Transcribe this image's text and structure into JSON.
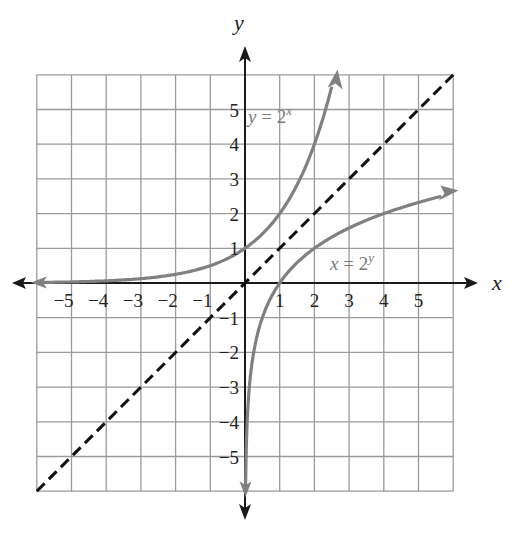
{
  "chart_data": {
    "type": "line",
    "title": "",
    "xlabel": "x",
    "ylabel": "y",
    "xlim": [
      -6,
      6
    ],
    "ylim": [
      -6,
      6
    ],
    "grid": true,
    "x_ticks": [
      -5,
      -4,
      -3,
      -2,
      -1,
      1,
      2,
      3,
      4,
      5
    ],
    "y_ticks": [
      -5,
      -4,
      -3,
      -2,
      -1,
      1,
      2,
      3,
      4,
      5
    ],
    "x_tick_labels": [
      "−5",
      "−4",
      "−3",
      "−2",
      "−1",
      "1",
      "2",
      "3",
      "4",
      "5"
    ],
    "y_tick_labels": [
      "−5",
      "−4",
      "−3",
      "−2",
      "−1",
      "1",
      "2",
      "3",
      "4",
      "5"
    ],
    "series": [
      {
        "name": "y = 2^x",
        "label_main": "y = 2",
        "label_sup": "x",
        "style": "solid",
        "color": "#808080",
        "x": [
          -6,
          -5,
          -4,
          -3,
          -2,
          -1,
          0,
          1,
          2,
          2.5
        ],
        "y": [
          0.016,
          0.031,
          0.063,
          0.125,
          0.25,
          0.5,
          1,
          2,
          4,
          5.66
        ]
      },
      {
        "name": "x = 2^y",
        "label_main": "x = 2",
        "label_sup": "y",
        "style": "solid",
        "color": "#808080",
        "x": [
          0.016,
          0.031,
          0.063,
          0.125,
          0.25,
          0.5,
          1,
          2,
          4,
          5.66
        ],
        "y": [
          -6,
          -5,
          -4,
          -3,
          -2,
          -1,
          0,
          1,
          2,
          2.5
        ]
      },
      {
        "name": "y = x",
        "style": "dashed",
        "color": "#111111",
        "x": [
          -6,
          6
        ],
        "y": [
          -6,
          6
        ]
      }
    ]
  }
}
